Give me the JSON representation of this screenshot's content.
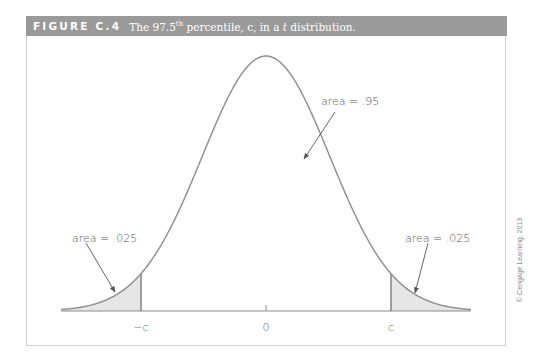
{
  "header": {
    "figure_number": "FIGURE C.4",
    "title_pre": "The 97.5",
    "title_sup": "th",
    "title_post": " percentile, c, in a ",
    "title_italic": "t",
    "title_end": " distribution."
  },
  "copyright": "© Cengage Learning, 2013",
  "colors": {
    "header_bg": "#9a9a9a",
    "curve": "#8c8c8c",
    "shade": "#e6e6e6",
    "text": "#555555"
  },
  "chart_data": {
    "type": "area",
    "title": "The 97.5th percentile, c, in a t distribution.",
    "distribution": "t (bell-shaped density)",
    "x_ticks": [
      "-c",
      "0",
      "c"
    ],
    "critical_value_label": "c",
    "critical_value_approx_sd": 1.96,
    "shaded_regions": [
      {
        "from": "-inf",
        "to": "-c",
        "area": 0.025
      },
      {
        "from": "c",
        "to": "inf",
        "area": 0.025
      }
    ],
    "annotations": [
      {
        "text": "area = .025",
        "points_to": "left tail"
      },
      {
        "text": "area = .95",
        "points_to": "center"
      },
      {
        "text": "area = .025",
        "points_to": "right tail"
      }
    ],
    "xlabel": "",
    "ylabel": "",
    "grid": false,
    "legend": "none"
  },
  "labels": {
    "left_area": "area = .025",
    "center_area": "area = .95",
    "right_area": "area = .025",
    "tick_neg_c": "−c",
    "tick_zero": "0",
    "tick_c": "c"
  }
}
